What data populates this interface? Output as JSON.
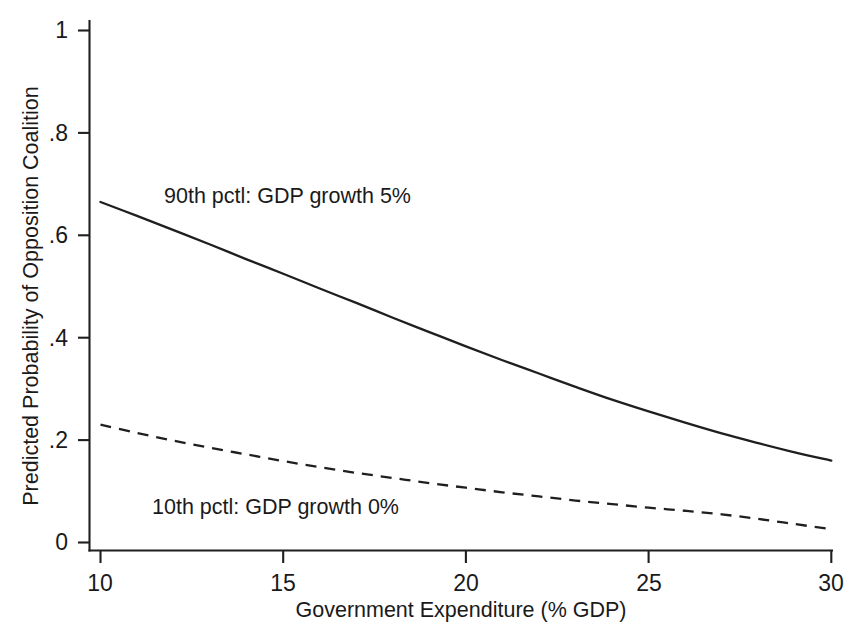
{
  "chart_data": {
    "type": "line",
    "title": "",
    "xlabel": "Government Expenditure (% GDP)",
    "ylabel": "Predicted Probability of Opposition Coalition",
    "xlim": [
      10,
      30
    ],
    "ylim": [
      0,
      1
    ],
    "xticks": [
      10,
      15,
      20,
      25,
      30
    ],
    "xtick_labels": [
      "10",
      "15",
      "20",
      "25",
      "30"
    ],
    "yticks": [
      0,
      0.2,
      0.4,
      0.6,
      0.8,
      1
    ],
    "ytick_labels": [
      "0",
      ".2",
      ".4",
      ".6",
      ".8",
      "1"
    ],
    "grid": false,
    "legend_position": "inline-annotations",
    "x": [
      10,
      11,
      12,
      13,
      14,
      15,
      16,
      17,
      18,
      19,
      20,
      21,
      22,
      23,
      24,
      25,
      26,
      27,
      28,
      29,
      30
    ],
    "series": [
      {
        "name": "90th pctl: GDP growth 5%",
        "style": "solid",
        "color": "#1f1f1f",
        "values": [
          0.665,
          0.638,
          0.61,
          0.582,
          0.553,
          0.525,
          0.496,
          0.468,
          0.439,
          0.411,
          0.383,
          0.356,
          0.33,
          0.304,
          0.279,
          0.256,
          0.234,
          0.213,
          0.194,
          0.176,
          0.16
        ]
      },
      {
        "name": "10th pctl: GDP growth 0%",
        "style": "dashed",
        "color": "#1f1f1f",
        "values": [
          0.23,
          0.214,
          0.199,
          0.185,
          0.172,
          0.159,
          0.147,
          0.136,
          0.126,
          0.116,
          0.107,
          0.098,
          0.09,
          0.082,
          0.075,
          0.068,
          0.062,
          0.055,
          0.046,
          0.036,
          0.026
        ]
      }
    ],
    "annotations": [
      {
        "text": "90th pctl: GDP growth 5%",
        "series": "90th pctl: GDP growth 5%"
      },
      {
        "text": "10th pctl: GDP growth 0%",
        "series": "10th pctl: GDP growth 0%"
      }
    ]
  }
}
